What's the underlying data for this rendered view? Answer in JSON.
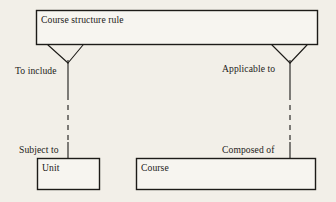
{
  "diagram": {
    "type": "entity-relationship-diagram",
    "background_color": "#f2efe8",
    "ink_color": "#1d1b18",
    "entities": [
      {
        "id": "course-structure-rule",
        "label": "Course structure rule",
        "x": 36,
        "y": 10,
        "width": 282,
        "height": 35
      },
      {
        "id": "unit",
        "label": "Unit",
        "x": 37,
        "y": 158,
        "width": 63,
        "height": 32
      },
      {
        "id": "course",
        "label": "Course",
        "x": 136,
        "y": 158,
        "width": 180,
        "height": 32
      }
    ],
    "relationships": [
      {
        "id": "left-relationship",
        "from": "course-structure-rule",
        "to": "unit",
        "from_label": "To include",
        "to_label": "Subject to",
        "from_cardinality": "crows-foot-many",
        "to_cardinality": "one",
        "line_style": "solid-dashed-solid"
      },
      {
        "id": "right-relationship",
        "from": "course-structure-rule",
        "to": "course",
        "from_label": "Applicable to",
        "to_label": "Composed of",
        "from_cardinality": "crows-foot-many",
        "to_cardinality": "one",
        "line_style": "solid-dashed-solid"
      }
    ]
  }
}
